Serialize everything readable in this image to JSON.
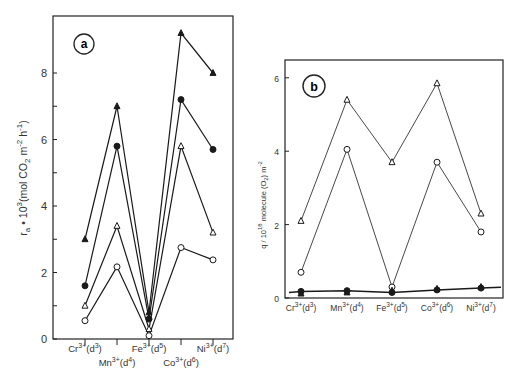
{
  "chart_data": [
    {
      "panel": "a",
      "type": "line",
      "title": "",
      "panel_label": "a",
      "xlabel": "",
      "ylabel": "r_a · 10^3 (mol CO2 m^-2 h^-1)",
      "ylabel_parts": {
        "main": "r",
        "sub": "a",
        "mid": " • 10",
        "sup": "3",
        "rest1": "(mol CO",
        "sub2": "2",
        "rest2": " m",
        "sup2": "-2",
        "rest3": " h",
        "sup3": "-1",
        "close": ")"
      },
      "categories": [
        "Cr3+(d3)",
        "Mn3+(d4)",
        "Fe3+(d5)",
        "Co3+(d6)",
        "Ni3+(d7)"
      ],
      "category_labels": [
        {
          "ion": "Cr",
          "charge": "3+",
          "d": "d",
          "n": "3",
          "row": 0
        },
        {
          "ion": "Mn",
          "charge": "3+",
          "d": "d",
          "n": "4",
          "row": 1
        },
        {
          "ion": "Fe",
          "charge": "3+",
          "d": "d",
          "n": "5",
          "row": 0
        },
        {
          "ion": "Co",
          "charge": "3+",
          "d": "d",
          "n": "6",
          "row": 1
        },
        {
          "ion": "Ni",
          "charge": "3+",
          "d": "d",
          "n": "7",
          "row": 0
        }
      ],
      "ylim": [
        0,
        9.6
      ],
      "yticks": [
        0,
        2,
        4,
        6,
        8
      ],
      "minor_yticks": [
        1,
        3,
        5,
        7
      ],
      "grid": false,
      "legend": null,
      "series": [
        {
          "name": "filled triangle",
          "marker": "triangle-filled",
          "values": [
            3.0,
            7.0,
            0.8,
            9.2,
            8.0
          ]
        },
        {
          "name": "filled circle",
          "marker": "circle-filled",
          "values": [
            1.6,
            5.8,
            0.6,
            7.2,
            5.7
          ]
        },
        {
          "name": "open triangle",
          "marker": "triangle-open",
          "values": [
            1.0,
            3.4,
            0.3,
            5.8,
            3.2
          ]
        },
        {
          "name": "open circle",
          "marker": "circle-open",
          "values": [
            0.55,
            2.17,
            0.1,
            2.75,
            2.38
          ]
        }
      ]
    },
    {
      "panel": "b",
      "type": "line",
      "title": "",
      "panel_label": "b",
      "xlabel": "",
      "ylabel": "q / 10^18 molecule (O2) m^-2",
      "ylabel_text": "q / 10",
      "ylabel_sup": "18",
      "ylabel_rest": " molecule (O",
      "ylabel_sub": "2",
      "ylabel_rest2": ") m",
      "ylabel_sup2": "-2",
      "categories": [
        "Cr3+(d3)",
        "Mn3+(d4)",
        "Fe3+(d5)",
        "Co3+(d6)",
        "Ni3+(d7)"
      ],
      "category_labels": [
        {
          "ion": "Cr",
          "charge": "3+",
          "d": "d",
          "n": "3"
        },
        {
          "ion": "Mn",
          "charge": "3+",
          "d": "d",
          "n": "4"
        },
        {
          "ion": "Fe",
          "charge": "3+",
          "d": "d",
          "n": "5"
        },
        {
          "ion": "Co",
          "charge": "3+",
          "d": "d",
          "n": "6"
        },
        {
          "ion": "Ni",
          "charge": "3+",
          "d": "d",
          "n": "7"
        }
      ],
      "ylim": [
        0,
        6.5
      ],
      "yticks": [
        0,
        2,
        4,
        6
      ],
      "grid": false,
      "legend": null,
      "series": [
        {
          "name": "open triangle",
          "marker": "triangle-open",
          "values": [
            2.1,
            5.4,
            3.7,
            5.85,
            2.3
          ]
        },
        {
          "name": "open circle",
          "marker": "circle-open",
          "values": [
            0.7,
            4.05,
            0.3,
            3.7,
            1.8
          ]
        },
        {
          "name": "filled circle",
          "marker": "circle-filled",
          "values": [
            0.18,
            0.2,
            0.15,
            0.22,
            0.27
          ]
        },
        {
          "name": "filled triangle",
          "marker": "triangle-filled",
          "values": [
            0.12,
            0.15,
            0.2,
            0.25,
            0.3
          ]
        }
      ]
    }
  ]
}
